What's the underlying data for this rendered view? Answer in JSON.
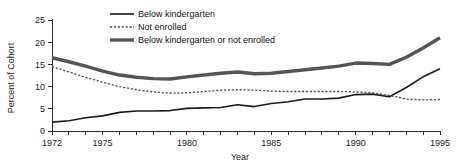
{
  "chart_data": {
    "type": "line",
    "title": "",
    "xlabel": "Year",
    "ylabel": "Percent of Cohort",
    "xlim": [
      1972,
      1995
    ],
    "ylim": [
      0,
      25
    ],
    "ytick_values": [
      0,
      5,
      10,
      15,
      20,
      25
    ],
    "ytick_labels": [
      "0",
      "5",
      "10",
      "15",
      "20",
      "25"
    ],
    "xtick_values": [
      1972,
      1975,
      1980,
      1985,
      1990,
      1995
    ],
    "xtick_labels": [
      "1972",
      "1975",
      "1980",
      "1985",
      "1990",
      "1995"
    ],
    "minor_xticks_every": 1,
    "grid": false,
    "legend_position": "top-center",
    "x": [
      1972,
      1973,
      1974,
      1975,
      1976,
      1977,
      1978,
      1979,
      1980,
      1981,
      1982,
      1983,
      1984,
      1985,
      1986,
      1987,
      1988,
      1989,
      1990,
      1991,
      1992,
      1993,
      1994,
      1995
    ],
    "series": [
      {
        "name": "Below kindergarten",
        "style": "solid-thin",
        "color": "#1a1a1a",
        "width": 1.6,
        "values": [
          2.0,
          2.3,
          3.0,
          3.4,
          4.2,
          4.5,
          4.5,
          4.6,
          5.1,
          5.2,
          5.3,
          5.9,
          5.5,
          6.2,
          6.6,
          7.2,
          7.2,
          7.4,
          8.2,
          8.3,
          7.7,
          9.8,
          12.2,
          14.0
        ]
      },
      {
        "name": "Not  enrolled",
        "style": "dotted",
        "color": "#4d4d4d",
        "width": 1.3,
        "values": [
          14.5,
          13.3,
          12.1,
          11.0,
          10.0,
          9.3,
          8.8,
          8.5,
          8.6,
          8.9,
          9.2,
          9.3,
          9.2,
          9.0,
          8.9,
          8.9,
          8.9,
          8.9,
          8.8,
          8.6,
          8.0,
          7.2,
          7.0,
          7.1
        ]
      },
      {
        "name": "Below kindergarten or not enrolled",
        "style": "solid-thick",
        "color": "#555555",
        "width": 3.4,
        "values": [
          16.5,
          15.6,
          14.6,
          13.5,
          12.6,
          12.1,
          11.8,
          11.7,
          12.2,
          12.6,
          13.0,
          13.3,
          12.9,
          13.0,
          13.4,
          13.8,
          14.2,
          14.6,
          15.3,
          15.2,
          15.0,
          16.6,
          18.7,
          21.0
        ]
      }
    ]
  },
  "legend": {
    "entries": [
      {
        "label": "Below kindergarten"
      },
      {
        "label": "Not  enrolled"
      },
      {
        "label": "Below kindergarten or not enrolled"
      }
    ]
  }
}
